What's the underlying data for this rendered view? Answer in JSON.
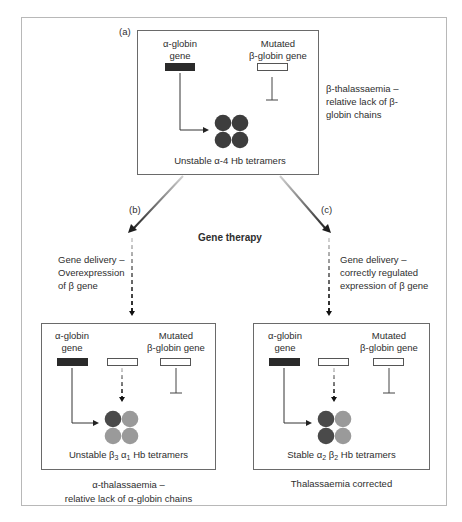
{
  "diagram": {
    "title_center": "Gene therapy",
    "panel_a": {
      "tag": "(a)",
      "alpha_gene_label_line1": "α-globin",
      "alpha_gene_label_line2": "gene",
      "beta_gene_label_line1": "Mutated",
      "beta_gene_label_line2": "β-globin gene",
      "tetramer_caption": "Unstable α-4 Hb tetramers",
      "side_note_line1": "β-thalassaemia –",
      "side_note_line2": "relative lack of β-",
      "side_note_line3": "globin chains",
      "tetramer_colors": [
        "#3d3d3d",
        "#3d3d3d",
        "#3d3d3d",
        "#3d3d3d"
      ]
    },
    "panel_b": {
      "tag": "(b)",
      "delivery_line1": "Gene delivery –",
      "delivery_line2": "Overexpression",
      "delivery_line3": "of β gene",
      "alpha_gene_label_line1": "α-globin",
      "alpha_gene_label_line2": "gene",
      "beta_gene_label_line1": "Mutated",
      "beta_gene_label_line2": "β-globin gene",
      "tetramer_caption_prefix": "Unstable β",
      "tetramer_caption_sub1": "3",
      "tetramer_caption_mid": " α",
      "tetramer_caption_sub2": "1",
      "tetramer_caption_suffix": " Hb tetramers",
      "outcome_line1": "α-thalassaemia –",
      "outcome_line2": "relative lack of α-globin chains",
      "tetramer_colors": [
        "#4a4a4a",
        "#9a9a9a",
        "#9a9a9a",
        "#9a9a9a"
      ]
    },
    "panel_c": {
      "tag": "(c)",
      "delivery_line1": "Gene delivery –",
      "delivery_line2": "correctly regulated",
      "delivery_line3": "expression of β gene",
      "alpha_gene_label_line1": "α-globin",
      "alpha_gene_label_line2": "gene",
      "beta_gene_label_line1": "Mutated",
      "beta_gene_label_line2": "β-globin gene",
      "tetramer_caption_prefix": "Stable α",
      "tetramer_caption_sub1": "2",
      "tetramer_caption_mid": " β",
      "tetramer_caption_sub2": "2",
      "tetramer_caption_suffix": " Hb tetramers",
      "outcome_line1": "Thalassaemia corrected",
      "tetramer_colors": [
        "#4a4a4a",
        "#9a9a9a",
        "#4a4a4a",
        "#9a9a9a"
      ]
    },
    "colors": {
      "frame": "#b8b8b8",
      "box_border": "#6a6a6a",
      "dark_gene": "#2a2a2a",
      "arrow": "#222222"
    }
  }
}
